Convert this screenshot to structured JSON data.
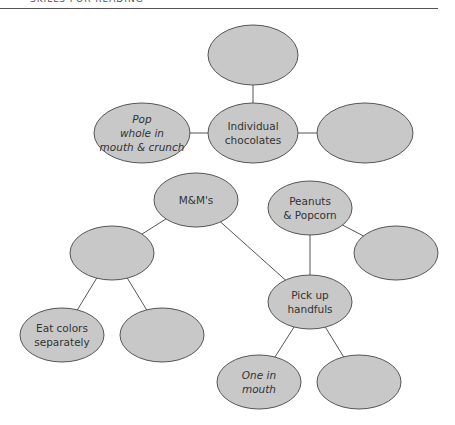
{
  "header": {
    "text": "SKILLS FOR READING"
  },
  "colors": {
    "node_fill": "#c8c8c8",
    "node_stroke": "#555555",
    "edge": "#555555",
    "background": "#ffffff"
  },
  "nodes": [
    {
      "id": "top",
      "label": "",
      "cx": 253,
      "cy": 55,
      "rx": 45,
      "ry": 30
    },
    {
      "id": "pop",
      "label": "Pop\nwhole in\nmouth & crunch",
      "cx": 142,
      "cy": 133,
      "rx": 48,
      "ry": 30
    },
    {
      "id": "individual",
      "label": "Individual\nchocolates",
      "cx": 253,
      "cy": 133,
      "rx": 45,
      "ry": 30
    },
    {
      "id": "right1",
      "label": "",
      "cx": 365,
      "cy": 133,
      "rx": 48,
      "ry": 30
    },
    {
      "id": "mms",
      "label": "M&M's",
      "cx": 196,
      "cy": 200,
      "rx": 42,
      "ry": 27
    },
    {
      "id": "peanuts",
      "label": "Peanuts\n& Popcorn",
      "cx": 310,
      "cy": 208,
      "rx": 42,
      "ry": 27
    },
    {
      "id": "left2",
      "label": "",
      "cx": 112,
      "cy": 253,
      "rx": 42,
      "ry": 27
    },
    {
      "id": "right2",
      "label": "",
      "cx": 396,
      "cy": 253,
      "rx": 42,
      "ry": 27
    },
    {
      "id": "pickup",
      "label": "Pick up\nhandfuls",
      "cx": 310,
      "cy": 302,
      "rx": 42,
      "ry": 27
    },
    {
      "id": "eatcolors",
      "label": "Eat colors\nseparately",
      "cx": 62,
      "cy": 335,
      "rx": 42,
      "ry": 27
    },
    {
      "id": "blank3",
      "label": "",
      "cx": 162,
      "cy": 335,
      "rx": 42,
      "ry": 27
    },
    {
      "id": "onein",
      "label": "One in\nmouth",
      "cx": 259,
      "cy": 382,
      "rx": 42,
      "ry": 27
    },
    {
      "id": "blank4",
      "label": "",
      "cx": 359,
      "cy": 382,
      "rx": 42,
      "ry": 27
    }
  ],
  "edges": [
    [
      "top",
      "individual"
    ],
    [
      "pop",
      "individual"
    ],
    [
      "individual",
      "right1"
    ],
    [
      "mms",
      "left2"
    ],
    [
      "mms",
      "pickup"
    ],
    [
      "peanuts",
      "pickup"
    ],
    [
      "peanuts",
      "right2"
    ],
    [
      "left2",
      "eatcolors"
    ],
    [
      "left2",
      "blank3"
    ],
    [
      "pickup",
      "onein"
    ],
    [
      "pickup",
      "blank4"
    ]
  ],
  "labels": {
    "pop": "Pop\nwhole in\nmouth & crunch",
    "individual": "Individual\nchocolates",
    "mms": "M&M's",
    "peanuts": "Peanuts\n& Popcorn",
    "pickup": "Pick up\nhandfuls",
    "eatcolors": "Eat colors\nseparately",
    "onein": "One in\nmouth"
  }
}
